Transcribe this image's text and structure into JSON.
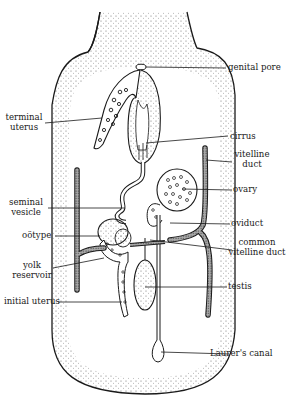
{
  "figure": {
    "colors": {
      "ink": "#1a1a1a",
      "background": "#ffffff",
      "stipple": "#555555"
    }
  },
  "labels": {
    "genital_pore": "genital pore",
    "terminal_uterus": [
      "terminal",
      "uterus"
    ],
    "cirrus": "cirrus",
    "vitelline_duct": [
      "vitelline",
      "duct"
    ],
    "ovary": "ovary",
    "seminal_vesicle": [
      "seminal",
      "vesicle"
    ],
    "ootype": "oötype",
    "oviduct": "oviduct",
    "common_vitelline_duct": [
      "common",
      "vitelline duct"
    ],
    "yolk_reservoir": [
      "yolk",
      "reservoir"
    ],
    "testis": "testis",
    "initial_uterus": "initial uterus",
    "laurers_canal": "Laurer's canal"
  }
}
